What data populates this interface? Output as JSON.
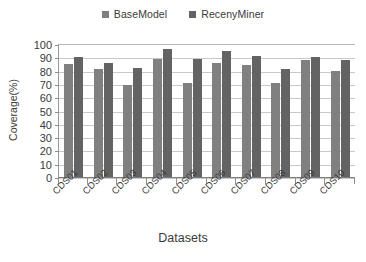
{
  "chart_data": {
    "type": "bar",
    "title": "",
    "xlabel": "Datasets",
    "ylabel": "Coverage(%)",
    "categories": [
      "CDS01",
      "CDS02",
      "CDS03",
      "CDS04",
      "CDS05",
      "CDS06",
      "CDS07",
      "CDS08",
      "CDS09",
      "CDS10"
    ],
    "series": [
      {
        "name": "BaseModel",
        "color": "#808080",
        "values": [
          85,
          81,
          69,
          89,
          71,
          86,
          84,
          71,
          88,
          80
        ]
      },
      {
        "name": "RecenyMiner",
        "color": "#636363",
        "values": [
          90,
          86,
          82,
          96,
          89,
          95,
          91,
          81,
          90,
          88
        ]
      }
    ],
    "ylim": [
      0,
      100
    ],
    "yticks": [
      0,
      10,
      20,
      30,
      40,
      50,
      60,
      70,
      80,
      90,
      100
    ],
    "ytick_labels": [
      "0",
      "10",
      "20",
      "30",
      "40",
      "50",
      "60",
      "70",
      "80",
      "90",
      "100"
    ],
    "grid": true,
    "grid_axis": "y",
    "legend_position": "top-center"
  },
  "legend": {
    "entries": [
      {
        "label": "BaseModel",
        "marker": "square-swatch-icon",
        "color": "#808080"
      },
      {
        "label": "RecenyMiner",
        "marker": "square-swatch-icon",
        "color": "#636363"
      }
    ]
  },
  "axes": {
    "y_title": "Coverage(%)",
    "x_title": "Datasets"
  }
}
